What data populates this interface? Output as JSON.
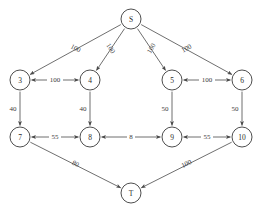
{
  "chart_data": {
    "type": "diagram",
    "diagram_kind": "directed-network-flow-graph",
    "title": "",
    "nodes": [
      {
        "id": "S",
        "label": "S",
        "x": 131,
        "y": 19,
        "r": 10
      },
      {
        "id": "3",
        "label": "3",
        "x": 20,
        "y": 80,
        "r": 10
      },
      {
        "id": "4",
        "label": "4",
        "x": 90,
        "y": 80,
        "r": 10
      },
      {
        "id": "5",
        "label": "5",
        "x": 172,
        "y": 80,
        "r": 10
      },
      {
        "id": "6",
        "label": "6",
        "x": 242,
        "y": 80,
        "r": 10
      },
      {
        "id": "7",
        "label": "7",
        "x": 20,
        "y": 137,
        "r": 10
      },
      {
        "id": "8",
        "label": "8",
        "x": 90,
        "y": 137,
        "r": 10
      },
      {
        "id": "9",
        "label": "9",
        "x": 172,
        "y": 137,
        "r": 10
      },
      {
        "id": "10",
        "label": "10",
        "x": 242,
        "y": 137,
        "r": 10
      },
      {
        "id": "T",
        "label": "T",
        "x": 131,
        "y": 193,
        "r": 10
      }
    ],
    "edges": [
      {
        "from": "S",
        "to": "3",
        "weight": "100",
        "direction": "forward",
        "label_rotate": 29
      },
      {
        "from": "S",
        "to": "4",
        "weight": "100",
        "direction": "forward",
        "label_rotate": 58
      },
      {
        "from": "S",
        "to": "5",
        "weight": "100",
        "direction": "forward",
        "label_rotate": -58
      },
      {
        "from": "S",
        "to": "6",
        "weight": "100",
        "direction": "forward",
        "label_rotate": -29
      },
      {
        "from": "3",
        "to": "4",
        "weight": "100",
        "direction": "bidirectional",
        "label_rotate": 0
      },
      {
        "from": "5",
        "to": "6",
        "weight": "100",
        "direction": "bidirectional",
        "label_rotate": 0
      },
      {
        "from": "3",
        "to": "7",
        "weight": "40",
        "direction": "forward",
        "label_rotate": 0
      },
      {
        "from": "4",
        "to": "8",
        "weight": "40",
        "direction": "forward",
        "label_rotate": 0
      },
      {
        "from": "5",
        "to": "9",
        "weight": "50",
        "direction": "forward",
        "label_rotate": 0
      },
      {
        "from": "6",
        "to": "10",
        "weight": "50",
        "direction": "forward",
        "label_rotate": 0
      },
      {
        "from": "7",
        "to": "8",
        "weight": "55",
        "direction": "bidirectional",
        "label_rotate": 0
      },
      {
        "from": "8",
        "to": "9",
        "weight": "8",
        "direction": "bidirectional",
        "label_rotate": 0
      },
      {
        "from": "9",
        "to": "10",
        "weight": "55",
        "direction": "bidirectional",
        "label_rotate": 0
      },
      {
        "from": "7",
        "to": "T",
        "weight": "80",
        "direction": "forward",
        "label_rotate": 26
      },
      {
        "from": "10",
        "to": "T",
        "weight": "100",
        "direction": "forward",
        "label_rotate": -26
      }
    ],
    "colors": {
      "background": "#ffffff",
      "node_stroke": "#3a3a3a",
      "node_fill": "#ffffff",
      "edge_stroke": "#4a4a4a",
      "text": "#2b2b2b"
    }
  }
}
